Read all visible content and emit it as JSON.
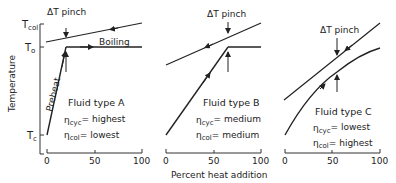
{
  "figure": {
    "y_axis_label": "Temperature",
    "x_axis_label": "Percent heat addition",
    "y_ticks": {
      "t_col": "T",
      "t_col_sub": "col",
      "t_o": "T",
      "t_o_sub": "o",
      "t_c": "T",
      "t_c_sub": "c"
    },
    "x_ticks": [
      "0",
      "50",
      "100"
    ],
    "pinch_label": "ΔT pinch",
    "colors": {
      "line": "#222222",
      "background": "#ffffff"
    }
  },
  "panels": [
    {
      "title": "Fluid type A",
      "eta_cyc_label": "η",
      "eta_cyc_sub": "cyc",
      "eta_cyc_value": "= highest",
      "eta_col_label": "η",
      "eta_col_sub": "col",
      "eta_col_value": "= lowest",
      "segment_labels": {
        "preheat": "Preheat",
        "boiling": "Boiling"
      }
    },
    {
      "title": "Fluid type B",
      "eta_cyc_label": "η",
      "eta_cyc_sub": "cyc",
      "eta_cyc_value": "= medium",
      "eta_col_label": "η",
      "eta_col_sub": "col",
      "eta_col_value": "= medium"
    },
    {
      "title": "Fluid type C",
      "eta_cyc_label": "η",
      "eta_cyc_sub": "cyc",
      "eta_cyc_value": "= lowest",
      "eta_col_label": "η",
      "eta_col_sub": "col",
      "eta_col_value": "= highest"
    }
  ]
}
